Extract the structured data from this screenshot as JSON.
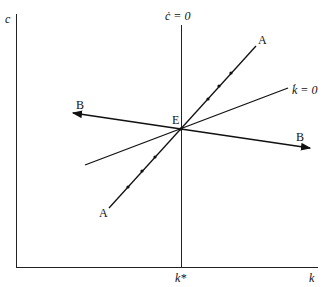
{
  "diagram": {
    "type": "phase-diagram",
    "axes": {
      "y_label": "c",
      "x_label": "k",
      "x_tick": "k*"
    },
    "curves": {
      "c_dot_zero": "ċ = 0",
      "k_dot_zero": "k̇ = 0",
      "stable_arm": "A",
      "unstable_arm": "B",
      "equilibrium": "E"
    },
    "colors": {
      "line": "#111111",
      "axis": "#222222",
      "background": "#ffffff"
    }
  }
}
